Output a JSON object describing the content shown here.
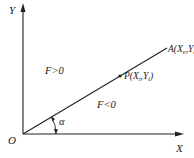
{
  "diagram": {
    "axes": {
      "y_label": "Y",
      "x_label": "X",
      "origin_label": "O"
    },
    "line": {
      "end_point": {
        "name": "A",
        "sub_x": "e",
        "sub_y": "e"
      }
    },
    "point": {
      "name": "P",
      "sub_x": "i",
      "sub_y": "i"
    },
    "regions": {
      "above": "F>0",
      "below": "F<0"
    },
    "angle": {
      "label": "α"
    },
    "colors": {
      "stroke": "#222222",
      "background": "#ffffff"
    }
  }
}
